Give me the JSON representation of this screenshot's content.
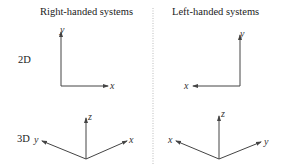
{
  "columns": {
    "left": {
      "title": "Right-handed systems"
    },
    "right": {
      "title": "Left-handed systems"
    }
  },
  "rows": {
    "2d": {
      "label": "2D"
    },
    "3d": {
      "label": "3D"
    }
  },
  "axes": {
    "x": "x",
    "y": "y",
    "z": "z"
  },
  "colors": {
    "line": "#444444",
    "divider": "#bbbbbb"
  }
}
